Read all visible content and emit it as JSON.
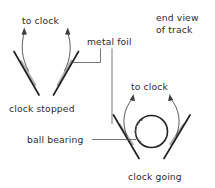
{
  "figure": {
    "background_color": "#ffffff",
    "rail_color": "#222222",
    "foil_color": "#b3b3b3",
    "wire_color": "#4a4a4a",
    "leader_color": "#565656",
    "text_color": "#2b2b2b"
  },
  "labels": {
    "to_clock_top": "to clock",
    "to_clock_bottom": "to clock",
    "metal_foil": "metal foil",
    "end_view_line1": "end view",
    "end_view_line2": "of track",
    "clock_stopped": "clock stopped",
    "ball_bearing": "ball bearing",
    "clock_going": "clock going"
  },
  "diagrams": [
    {
      "name": "clock-stopped",
      "caption": "clock stopped",
      "has_ball": false,
      "lead_label": "to clock",
      "description": "V-shaped pair of rails with metal foil strips, no ball bearing present, circuit open"
    },
    {
      "name": "clock-going",
      "caption": "clock going",
      "has_ball": true,
      "lead_label": "to clock",
      "description": "V-shaped pair of rails with metal foil strips, ball bearing resting in the V closing the circuit"
    }
  ],
  "annotations": [
    {
      "name": "metal-foil",
      "text": "metal foil",
      "points_to": [
        "clock-stopped-right-rail",
        "clock-going-left-rail"
      ]
    },
    {
      "name": "ball-bearing",
      "text": "ball bearing",
      "points_to": [
        "clock-going-ball"
      ]
    },
    {
      "name": "end-view",
      "text": "end view of track",
      "points_to": []
    }
  ]
}
